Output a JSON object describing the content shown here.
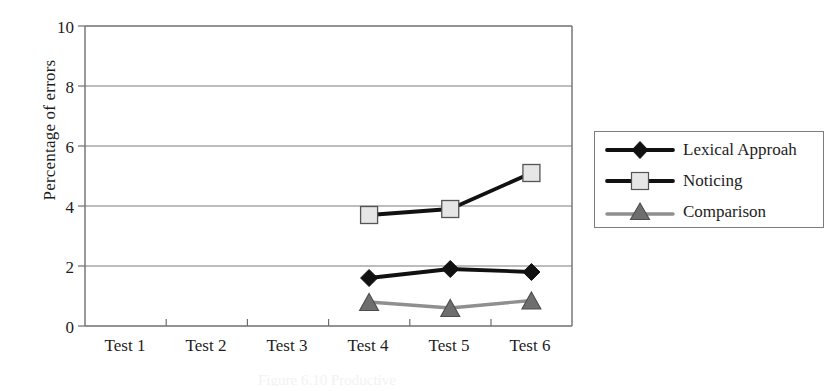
{
  "chart_data": {
    "type": "line",
    "title": "",
    "xlabel": "",
    "ylabel": "Percentage of errors",
    "categories": [
      "Test 1",
      "Test 2",
      "Test 3",
      "Test 4",
      "Test 5",
      "Test 6"
    ],
    "ylim": [
      0,
      10
    ],
    "yticks": [
      0,
      2,
      4,
      6,
      8,
      10
    ],
    "ytick_labels": [
      "0",
      "2",
      "4",
      "6",
      "8",
      "10"
    ],
    "grid": "horizontal",
    "legend_position": "right",
    "series": [
      {
        "name": "Lexical Approah",
        "marker": "diamond",
        "color": "#111111",
        "marker_fill": "#111111",
        "values": [
          null,
          null,
          null,
          1.6,
          1.9,
          1.8
        ]
      },
      {
        "name": "Noticing",
        "marker": "square",
        "color": "#111111",
        "marker_fill": "#e6e6e6",
        "values": [
          null,
          null,
          null,
          3.7,
          3.9,
          5.1
        ]
      },
      {
        "name": "Comparison",
        "marker": "triangle",
        "color": "#8f8f8f",
        "marker_fill": "#6e6e6e",
        "values": [
          null,
          null,
          null,
          0.8,
          0.6,
          0.85
        ]
      }
    ]
  },
  "axes": {
    "y_title": "Percentage of errors",
    "y_tick_labels": [
      "10",
      "8",
      "6",
      "4",
      "2",
      "0"
    ],
    "x_tick_labels": [
      "Test 1",
      "Test 2",
      "Test 3",
      "Test 4",
      "Test 5",
      "Test 6"
    ]
  },
  "legend": {
    "entries": [
      {
        "label": "Lexical Approah"
      },
      {
        "label": "Noticing"
      },
      {
        "label": "Comparison"
      }
    ]
  },
  "caption": {
    "remnant": "Figure 6.10 Productive"
  },
  "colors": {
    "axis": "#6f6f6f",
    "grid": "#7a7a7a",
    "series_dark": "#111111",
    "series_gray": "#8f8f8f",
    "marker_light": "#e6e6e6",
    "marker_gray": "#6e6e6e",
    "background": "#ffffff"
  }
}
